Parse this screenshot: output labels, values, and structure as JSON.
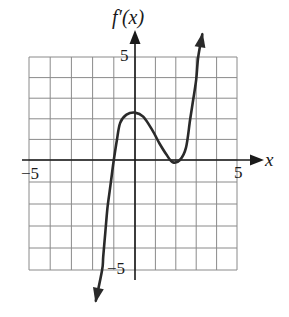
{
  "chart_data": {
    "type": "line",
    "title": "f′(x)",
    "xlabel": "x",
    "ylabel": "f′(x)",
    "xlim": [
      -5,
      5
    ],
    "ylim": [
      -5,
      5
    ],
    "grid": true,
    "grid_step": 1,
    "tick_labels": {
      "x": [
        "−5",
        "5"
      ],
      "y": [
        "5",
        "−5"
      ]
    },
    "series": [
      {
        "name": "f′(x)",
        "x": [
          -1.85,
          -1.55,
          -1.5,
          -1.4,
          -1.3,
          -1.15,
          -1.0,
          -0.85,
          -0.7,
          -0.4,
          0.0,
          0.4,
          0.85,
          1.2,
          1.55,
          1.85,
          2.2,
          2.5,
          2.7,
          2.85,
          3.0,
          3.1,
          3.3
        ],
        "y": [
          -6.4,
          -5.0,
          -4.4,
          -3.3,
          -2.2,
          -1.1,
          0.0,
          1.0,
          1.8,
          2.2,
          2.3,
          2.1,
          1.45,
          0.8,
          0.25,
          -0.1,
          0.0,
          0.6,
          1.95,
          2.9,
          3.9,
          5.0,
          6.1
        ]
      }
    ],
    "features": {
      "zero_crossing": -1,
      "local_max": [
        0,
        2.3
      ],
      "local_min": [
        2,
        -0.1
      ],
      "end_behavior": "left end arrow down, right end arrow up"
    }
  },
  "labels": {
    "title": "f′(x)",
    "x_axis_var": "x",
    "x_min_tick": "−5",
    "x_max_tick": "5",
    "y_max_tick": "5",
    "y_min_tick": "−5"
  }
}
